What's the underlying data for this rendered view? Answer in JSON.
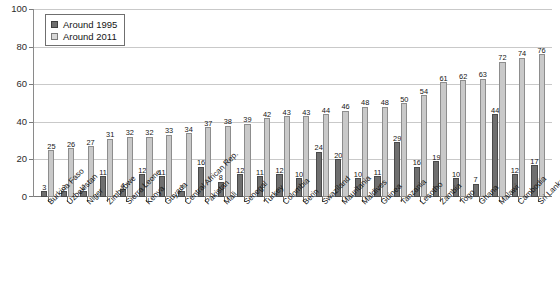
{
  "chart_data": {
    "type": "bar",
    "title": "",
    "xlabel": "",
    "ylabel": "",
    "ylim": [
      0,
      100
    ],
    "yticks": [
      0,
      20,
      40,
      60,
      80,
      100
    ],
    "grid": true,
    "legend_position": "top-left",
    "categories": [
      "Burkina Faso",
      "Uzbekistan",
      "Niger",
      "Zimbabwe",
      "Sierra Leone",
      "Kenya",
      "Guyana",
      "Central African Rep.",
      "Pakistan",
      "Mali",
      "Senegal",
      "Turkey",
      "Colombia",
      "Berin",
      "Swaziland",
      "Mauritania",
      "Maldives",
      "Guinea",
      "Tanzania",
      "Lesotho",
      "Zambia",
      "Togo",
      "Ghana",
      "Malawi",
      "Cambodia",
      "Sri Lanka"
    ],
    "series": [
      {
        "name": "Around 1995",
        "color": "#6f6f6f",
        "values": [
          3,
          3,
          3,
          11,
          4,
          12,
          11,
          3,
          16,
          8,
          12,
          11,
          12,
          10,
          24,
          20,
          10,
          11,
          29,
          16,
          19,
          10,
          7,
          44,
          12,
          17
        ]
      },
      {
        "name": "Around 2011",
        "color": "#c9c9c9",
        "values": [
          25,
          26,
          27,
          31,
          32,
          32,
          33,
          34,
          37,
          38,
          39,
          42,
          43,
          43,
          44,
          46,
          48,
          48,
          50,
          54,
          61,
          62,
          63,
          72,
          74,
          76
        ]
      }
    ]
  },
  "legend": {
    "items": [
      {
        "label": "Around 1995",
        "swatch": "dark-square"
      },
      {
        "label": "Around 2011",
        "swatch": "light-square"
      }
    ]
  },
  "caption": {
    "text": ""
  }
}
